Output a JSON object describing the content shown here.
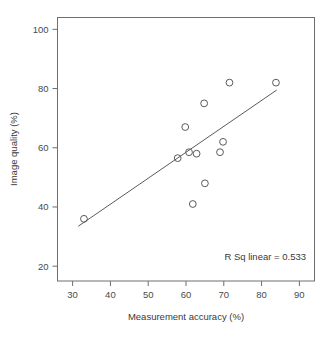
{
  "chart_data": {
    "type": "scatter",
    "title": "",
    "xlabel": "Measurement accuracy (%)",
    "ylabel": "Image quality (%)",
    "xlim": [
      26,
      94
    ],
    "ylim": [
      15,
      104
    ],
    "xticks": [
      30,
      40,
      50,
      60,
      70,
      80,
      90
    ],
    "xticklabels": [
      "30",
      "40",
      "50",
      "60",
      "70",
      "80",
      "90"
    ],
    "yticks": [
      20,
      40,
      60,
      80,
      100
    ],
    "yticklabels": [
      "20",
      "40",
      "60",
      "80",
      "100"
    ],
    "grid": false,
    "legend": null,
    "marker": "open-circle",
    "marker_color": "#5a5a5a",
    "points": [
      {
        "x": 33.0,
        "y": 36.0
      },
      {
        "x": 57.8,
        "y": 56.5
      },
      {
        "x": 59.8,
        "y": 67.0
      },
      {
        "x": 60.8,
        "y": 58.5
      },
      {
        "x": 61.8,
        "y": 41.0
      },
      {
        "x": 62.8,
        "y": 58.0
      },
      {
        "x": 64.8,
        "y": 75.0
      },
      {
        "x": 65.0,
        "y": 48.0
      },
      {
        "x": 69.0,
        "y": 58.5
      },
      {
        "x": 69.8,
        "y": 62.0
      },
      {
        "x": 71.5,
        "y": 82.0
      },
      {
        "x": 83.8,
        "y": 82.0
      }
    ],
    "fit_line": {
      "type": "linear",
      "x_start": 31.5,
      "y_start": 33.5,
      "x_end": 84.0,
      "y_end": 79.5,
      "color": "#5a5a5a"
    },
    "annotations": [
      {
        "name": "r-squared",
        "text": "R Sq linear = 0.533",
        "x": 83.0,
        "y": 23.5
      }
    ]
  }
}
